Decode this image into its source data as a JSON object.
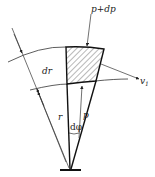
{
  "diagram": {
    "type": "mechanics-free-body-element",
    "labels": {
      "outer_pressure": "p+dp",
      "inner_pressure": "p",
      "radial_thickness": "dr",
      "radius": "r",
      "angle": "dφ",
      "velocity": "v",
      "velocity_subscript": "1"
    },
    "colors": {
      "line": "#222222",
      "background": "#ffffff"
    }
  }
}
